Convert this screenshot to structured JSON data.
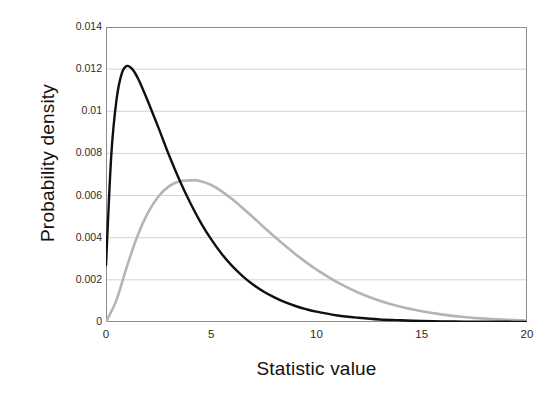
{
  "chart_data": {
    "type": "line",
    "title": "",
    "xlabel": "Statistic value",
    "ylabel": "Probability density",
    "xlim": [
      0,
      20
    ],
    "ylim": [
      0,
      0.014
    ],
    "grid": true,
    "legend_position": "none",
    "xticks": [
      "0",
      "5",
      "10",
      "15",
      "20"
    ],
    "xtick_values": [
      0,
      5,
      10,
      15,
      20
    ],
    "yticks": [
      "0",
      "0.002",
      "0.004",
      "0.006",
      "0.008",
      "0.01",
      "0.012",
      "0.014"
    ],
    "ytick_values": [
      0,
      0.002,
      0.004,
      0.006,
      0.008,
      0.01,
      0.012,
      0.014
    ],
    "series": [
      {
        "name": "black-curve",
        "color": "#101010",
        "peak_x": 1.0,
        "peak_y": 0.01215,
        "x": [
          0,
          0.25,
          0.5,
          0.75,
          1.0,
          1.25,
          1.5,
          1.75,
          2.0,
          2.5,
          3.0,
          3.5,
          4.0,
          4.5,
          5.0,
          5.5,
          6.0,
          6.5,
          7.0,
          7.5,
          8.0,
          8.5,
          9.0,
          9.5,
          10.0,
          11.0,
          12.0,
          13.0,
          14.0,
          15.0,
          16.0,
          17.0,
          18.0,
          19.0,
          20.0
        ],
        "values": [
          0.0027,
          0.0079,
          0.01055,
          0.0118,
          0.01215,
          0.012,
          0.0116,
          0.01105,
          0.01045,
          0.0092,
          0.0079,
          0.00672,
          0.00566,
          0.00472,
          0.00392,
          0.00323,
          0.00265,
          0.00217,
          0.00177,
          0.00144,
          0.00117,
          0.00094,
          0.00076,
          0.00061,
          0.00049,
          0.00031,
          0.0002,
          0.00012,
          8e-05,
          5e-05,
          3e-05,
          2e-05,
          1e-05,
          1e-05,
          0.0
        ]
      },
      {
        "name": "gray-curve",
        "color": "#b4b4b4",
        "peak_x": 4.3,
        "peak_y": 0.00672,
        "x": [
          0,
          0.5,
          1.0,
          1.5,
          2.0,
          2.5,
          3.0,
          3.5,
          4.0,
          4.3,
          4.5,
          5.0,
          5.5,
          6.0,
          6.5,
          7.0,
          7.5,
          8.0,
          8.5,
          9.0,
          9.5,
          10.0,
          11.0,
          12.0,
          13.0,
          14.0,
          15.0,
          16.0,
          17.0,
          18.0,
          19.0,
          20.0
        ],
        "values": [
          0.0,
          0.00105,
          0.00265,
          0.0041,
          0.0052,
          0.00597,
          0.00645,
          0.00668,
          0.00672,
          0.00672,
          0.00668,
          0.0065,
          0.0062,
          0.00582,
          0.0054,
          0.00496,
          0.0045,
          0.00406,
          0.00363,
          0.00322,
          0.00284,
          0.00249,
          0.00188,
          0.00139,
          0.00101,
          0.00072,
          0.00051,
          0.00035,
          0.00024,
          0.00016,
          0.00011,
          7e-05
        ]
      }
    ]
  },
  "axis": {
    "y_title": "Probability density",
    "x_title": "Statistic value"
  },
  "colors": {
    "series_black": "#101010",
    "series_gray": "#b4b4b4",
    "gridline": "#d2d2d2",
    "axis": "#8c8c8c",
    "text": "#1a1a1a",
    "background": "#ffffff"
  }
}
